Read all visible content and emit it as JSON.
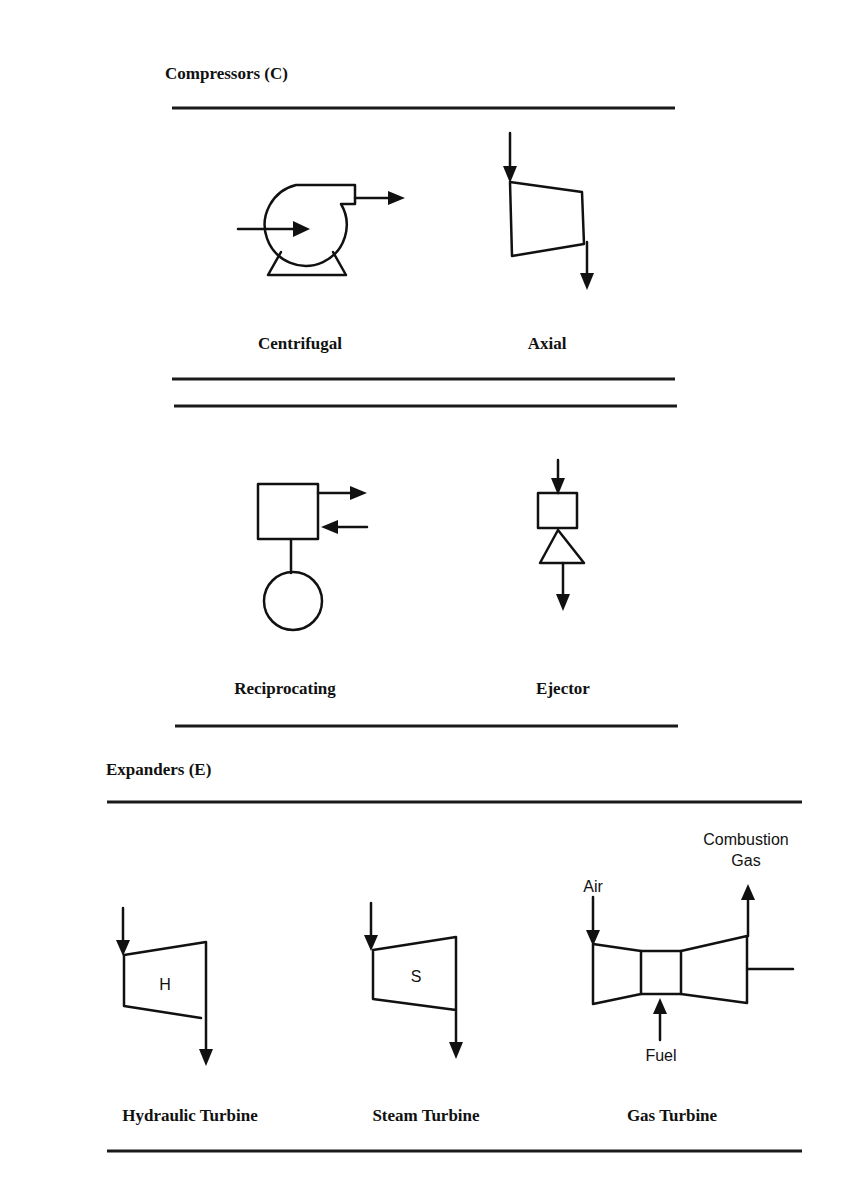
{
  "compressors": {
    "title": "Compressors (C)",
    "items": [
      {
        "label": "Centrifugal",
        "icon": "centrifugal-compressor-icon"
      },
      {
        "label": "Axial",
        "icon": "axial-compressor-icon"
      },
      {
        "label": "Reciprocating",
        "icon": "reciprocating-compressor-icon"
      },
      {
        "label": "Ejector",
        "icon": "ejector-icon"
      }
    ]
  },
  "expanders": {
    "title": "Expanders (E)",
    "items": [
      {
        "label": "Hydraulic Turbine",
        "icon": "hydraulic-turbine-icon",
        "symbol": "H"
      },
      {
        "label": "Steam Turbine",
        "icon": "steam-turbine-icon",
        "symbol": "S"
      },
      {
        "label": "Gas Turbine",
        "icon": "gas-turbine-icon",
        "annotations": {
          "air": "Air",
          "fuel": "Fuel",
          "exhaust_line1": "Combustion",
          "exhaust_line2": "Gas"
        }
      }
    ]
  },
  "colors": {
    "stroke": "#111111",
    "background": "#ffffff"
  }
}
